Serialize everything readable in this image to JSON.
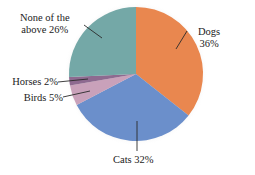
{
  "chart_data": {
    "type": "pie",
    "title": "",
    "start_angle_deg": 0,
    "direction": "clockwise",
    "slices": [
      {
        "label": "Dogs",
        "value": 36,
        "display": "36%",
        "color": "#E9874F"
      },
      {
        "label": "Cats",
        "value": 32,
        "display": "32%",
        "color": "#6B8FCB"
      },
      {
        "label": "Birds",
        "value": 5,
        "display": "5%",
        "color": "#C9A1BA"
      },
      {
        "label": "Horses",
        "value": 2,
        "display": "2%",
        "color": "#8E6A90"
      },
      {
        "label": "None of the above",
        "value": 26,
        "display": "26%",
        "color": "#74A8A7"
      }
    ],
    "legend": "none (direct labels with leader lines)"
  },
  "labels": {
    "dogs_line1": "Dogs",
    "dogs_line2": "36%",
    "cats": "Cats 32%",
    "birds": "Birds 5%",
    "horses": "Horses 2%",
    "none_line1": "None of the",
    "none_line2": "above 26%"
  }
}
